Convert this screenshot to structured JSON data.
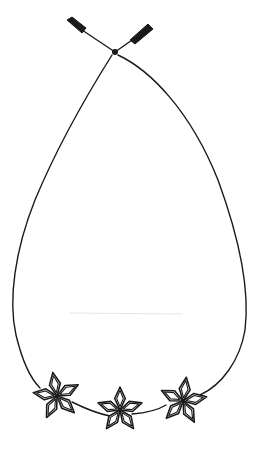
{
  "image": {
    "subject": "necklace line drawing",
    "width": 256,
    "height": 460,
    "background": "#ffffff",
    "ink_color": "#1a1a1a"
  },
  "necklace": {
    "cord": {
      "knot": [
        115,
        52
      ],
      "end_left": [
        70,
        22
      ],
      "end_right": [
        150,
        25
      ]
    },
    "pendants": [
      {
        "name": "star-flower-left",
        "cx": 57,
        "cy": 396,
        "r": 24,
        "rotation": -10,
        "petals": 5
      },
      {
        "name": "star-flower-center",
        "cx": 120,
        "cy": 410,
        "r": 23,
        "rotation": 0,
        "petals": 5
      },
      {
        "name": "star-flower-right",
        "cx": 183,
        "cy": 401,
        "r": 24,
        "rotation": 8,
        "petals": 5
      }
    ]
  }
}
